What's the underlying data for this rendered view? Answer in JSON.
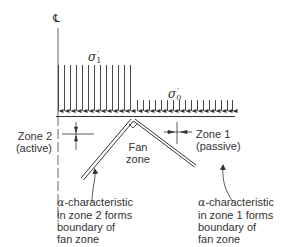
{
  "diagram": {
    "centerline_symbol": "℄",
    "stresses": {
      "high": {
        "symbol": "σ",
        "subscript": "1",
        "prime": "′"
      },
      "low": {
        "symbol": "σ",
        "subscript": "0",
        "prime": "′"
      }
    },
    "zones": {
      "zone2": {
        "line1": "Zone 2",
        "line2": "(active)"
      },
      "zone1": {
        "line1": "Zone 1",
        "line2": "(passive)"
      },
      "fan": {
        "line1": "Fan",
        "line2": "zone"
      }
    },
    "annotations": {
      "left": {
        "alpha": "α",
        "line1": "-characteristic",
        "line2": "in zone 2 forms",
        "line3": "boundary of",
        "line4": "fan zone"
      },
      "right": {
        "alpha": "α",
        "line1": "-characteristic",
        "line2": "in zone 1 forms",
        "line3": "boundary of",
        "line4": "fan zone"
      }
    },
    "colors": {
      "line": "#333333",
      "background": "#ffffff"
    }
  }
}
